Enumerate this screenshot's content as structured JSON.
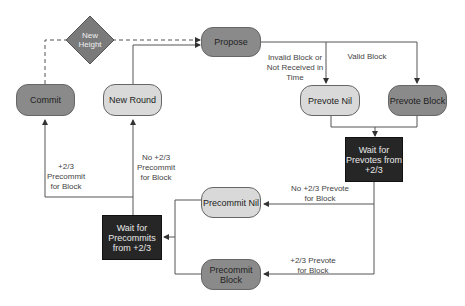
{
  "diagram": {
    "type": "state-flow",
    "nodes": {
      "new_height": "New\nHeight",
      "propose": "Propose",
      "commit": "Commit",
      "new_round": "New Round",
      "prevote_nil": "Prevote Nil",
      "prevote_block": "Prevote Block",
      "wait_prevotes": "Wait for\nPrevotes from\n+2/3",
      "precommit_nil": "Precommit Nil",
      "precommit_block": "Precommit Block",
      "wait_precommits": "Wait for\nPrecommits\nfrom +2/3"
    },
    "edge_labels": {
      "invalid_block": "Invalid Block or\nNot Received in\nTime",
      "valid_block": "Valid Block",
      "commit_precommit": "+2/3\nPrecommit\nfor Block",
      "no_precommit": "No +2/3\nPrecommit\nfor Block",
      "no_prevote": "No +2/3 Prevote\nfor Block",
      "yes_prevote": "+2/3 Prevote\nfor Block"
    },
    "colors": {
      "dark_node": "#8a8a8a",
      "light_node": "#d9d9d9",
      "box_node": "#262626",
      "diamond": "#7a7a7a",
      "edge": "#555555"
    }
  }
}
